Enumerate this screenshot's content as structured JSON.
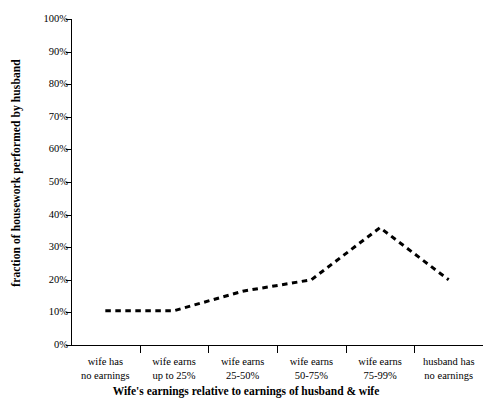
{
  "chart_data": {
    "type": "line",
    "title": "",
    "xlabel": "Wife's earnings relative to earnings of husband & wife",
    "ylabel": "fraction of housework performed by husband",
    "categories": [
      "wife has no earnings",
      "wife earns up to 25%",
      "wife earns 25-50%",
      "wife earns 50-75%",
      "wife earns 75-99%",
      "husband has no earnings"
    ],
    "category_lines": [
      [
        "wife has",
        "no earnings"
      ],
      [
        "wife earns",
        "up to 25%"
      ],
      [
        "wife earns",
        "25-50%"
      ],
      [
        "wife earns",
        "50-75%"
      ],
      [
        "wife earns",
        "75-99%"
      ],
      [
        "husband has",
        "no earnings"
      ]
    ],
    "values": [
      10.5,
      10.5,
      16.5,
      20,
      36,
      20
    ],
    "ylim": [
      0,
      100
    ],
    "ytick_values": [
      0,
      10,
      20,
      30,
      40,
      50,
      60,
      70,
      80,
      90,
      100
    ],
    "ytick_labels": [
      "0%",
      "10%",
      "20%",
      "30%",
      "40%",
      "50%",
      "60%",
      "70%",
      "80%",
      "90%",
      "100%"
    ],
    "grid": false,
    "legend": "none",
    "line_style": "dashed",
    "line_color": "#000000",
    "line_width": 3,
    "markers": "none",
    "background_color": "#ffffff"
  }
}
